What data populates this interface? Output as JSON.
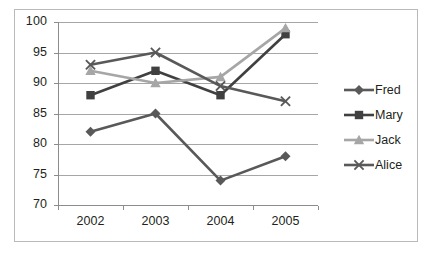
{
  "chart_data": {
    "type": "line",
    "title": "",
    "subtitle": "",
    "xlabel": "",
    "ylabel": "",
    "categories": [
      "2002",
      "2003",
      "2004",
      "2005"
    ],
    "ylim": [
      70,
      100
    ],
    "yticks": [
      70,
      75,
      80,
      85,
      90,
      95,
      100
    ],
    "ytick_labels": [
      "70",
      "75",
      "80",
      "85",
      "90",
      "95",
      "100"
    ],
    "grid": true,
    "legend_position": "right",
    "series": [
      {
        "name": "Fred",
        "values": [
          82,
          85,
          74,
          78
        ],
        "color": "#595959",
        "marker": "diamond"
      },
      {
        "name": "Mary",
        "values": [
          88,
          92,
          88,
          98
        ],
        "color": "#404040",
        "marker": "square"
      },
      {
        "name": "Jack",
        "values": [
          92,
          90,
          91,
          99
        ],
        "color": "#a6a6a6",
        "marker": "triangle"
      },
      {
        "name": "Alice",
        "values": [
          93,
          95,
          89.5,
          87
        ],
        "color": "#595959",
        "marker": "x"
      }
    ]
  },
  "legend": {
    "items": [
      {
        "label": "Fred"
      },
      {
        "label": "Mary"
      },
      {
        "label": "Jack"
      },
      {
        "label": "Alice"
      }
    ]
  },
  "axes": {
    "x_tick_labels": [
      "2002",
      "2003",
      "2004",
      "2005"
    ],
    "y_tick_labels": [
      "100",
      "95",
      "90",
      "85",
      "80",
      "75",
      "70"
    ]
  },
  "colors": {
    "gridline": "#a6a6a6",
    "axis": "#8c8c8c",
    "text": "#231f20",
    "border": "#b9b9b9",
    "background": "#ffffff"
  }
}
